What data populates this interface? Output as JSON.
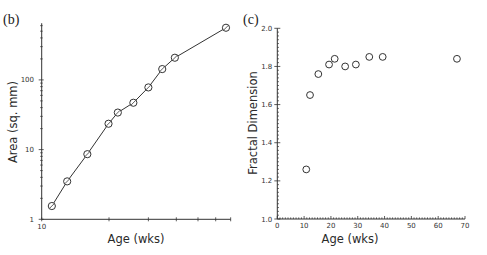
{
  "chart_data": [
    {
      "panel": "(b)",
      "type": "line",
      "title": "",
      "xlabel": "Age (wks)",
      "ylabel": "Area (sq. mm)",
      "xscale": "log",
      "yscale": "log",
      "xlim": [
        10,
        70
      ],
      "ylim": [
        1,
        650
      ],
      "x_tick_labels": [
        "10"
      ],
      "x_ticks": [
        10,
        20,
        30,
        40,
        50,
        60,
        70
      ],
      "y_tick_labels": [
        "1",
        "10",
        "100"
      ],
      "y_ticks": [
        1,
        10,
        100
      ],
      "grid": false,
      "legend": null,
      "marker": "circle-with-slash",
      "x": [
        11.1,
        13.0,
        16.0,
        19.9,
        21.9,
        25.7,
        30.0,
        34.6,
        39.4,
        66.7
      ],
      "y": [
        1.55,
        3.5,
        8.6,
        23.5,
        34,
        47,
        78,
        143,
        208,
        560
      ]
    },
    {
      "panel": "(c)",
      "type": "scatter",
      "title": "",
      "xlabel": "Age (wks)",
      "ylabel": "Fractal Dimension",
      "xscale": "linear",
      "yscale": "linear",
      "xlim": [
        0,
        70
      ],
      "ylim": [
        1.0,
        2.0
      ],
      "x_tick_labels": [
        "0",
        "10",
        "20",
        "30",
        "40",
        "50",
        "60",
        "70"
      ],
      "x_ticks": [
        0,
        10,
        20,
        30,
        40,
        50,
        60,
        70
      ],
      "y_tick_labels": [
        "1.0",
        "1.2",
        "1.4",
        "1.6",
        "1.8",
        "2.0"
      ],
      "y_ticks": [
        1.0,
        1.2,
        1.4,
        1.6,
        1.8,
        2.0
      ],
      "grid": false,
      "legend": null,
      "marker": "open-circle",
      "x": [
        10.8,
        12.2,
        15.3,
        19.3,
        21.4,
        25.3,
        29.3,
        34.3,
        39.3,
        67.0
      ],
      "y": [
        1.26,
        1.65,
        1.76,
        1.81,
        1.84,
        1.8,
        1.81,
        1.85,
        1.85,
        1.84
      ]
    }
  ],
  "panels": {
    "b": {
      "label": "(b)",
      "xlabel": "Age (wks)",
      "ylabel": "Area (sq. mm)",
      "x_tick_10": "10",
      "y_tick_1": "1",
      "y_tick_10": "10",
      "y_tick_100": "100"
    },
    "c": {
      "label": "(c)",
      "xlabel": "Age (wks)",
      "ylabel": "Fractal Dimension"
    }
  }
}
